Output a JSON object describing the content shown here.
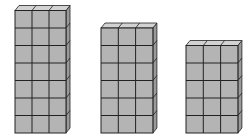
{
  "diagram": {
    "colors": {
      "front": "#b4b4b4",
      "top": "#d2d2d2",
      "side": "#9a9a9a",
      "line": "#222222",
      "background": "#ffffff"
    },
    "stacks": [
      {
        "id": "stack-1",
        "columns": 3,
        "rows": 7,
        "x": 15,
        "bottom": 133,
        "cell_w": 17,
        "cell_h": 17.5
      },
      {
        "id": "stack-2",
        "columns": 3,
        "rows": 6,
        "x": 101,
        "bottom": 133,
        "cell_w": 17.3,
        "cell_h": 17.5
      },
      {
        "id": "stack-3",
        "columns": 3,
        "rows": 5,
        "x": 186,
        "bottom": 133,
        "cell_w": 17.3,
        "cell_h": 17.5
      }
    ],
    "depth": {
      "dx": 4,
      "dy": 5
    }
  }
}
